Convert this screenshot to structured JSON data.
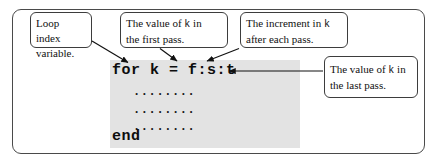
{
  "figure": {
    "frame_color": "#4a4a4a",
    "code_block_color": "#e3e3e3",
    "text_color": "#111111"
  },
  "code": {
    "header_line": "for k = f:s:t",
    "body_lines": [
      "........",
      "........",
      "........"
    ],
    "end_line": "end"
  },
  "callouts": [
    {
      "id": "loop-index",
      "line1": "Loop index",
      "line2": "variable.",
      "target": "k"
    },
    {
      "id": "first-pass",
      "line1_a": "The   value   of ",
      "line1_code": "k",
      "line1_b": " in",
      "line2": "the first pass.",
      "target": "f"
    },
    {
      "id": "increment",
      "line1_a": "The increment in ",
      "line1_code": "k",
      "line1_b": "",
      "line2": "after each pass.",
      "target": "s"
    },
    {
      "id": "last-pass",
      "line1_a": "The value of ",
      "line1_code": "k",
      "line1_b": " in",
      "line2": "the last pass.",
      "target": "t"
    }
  ]
}
